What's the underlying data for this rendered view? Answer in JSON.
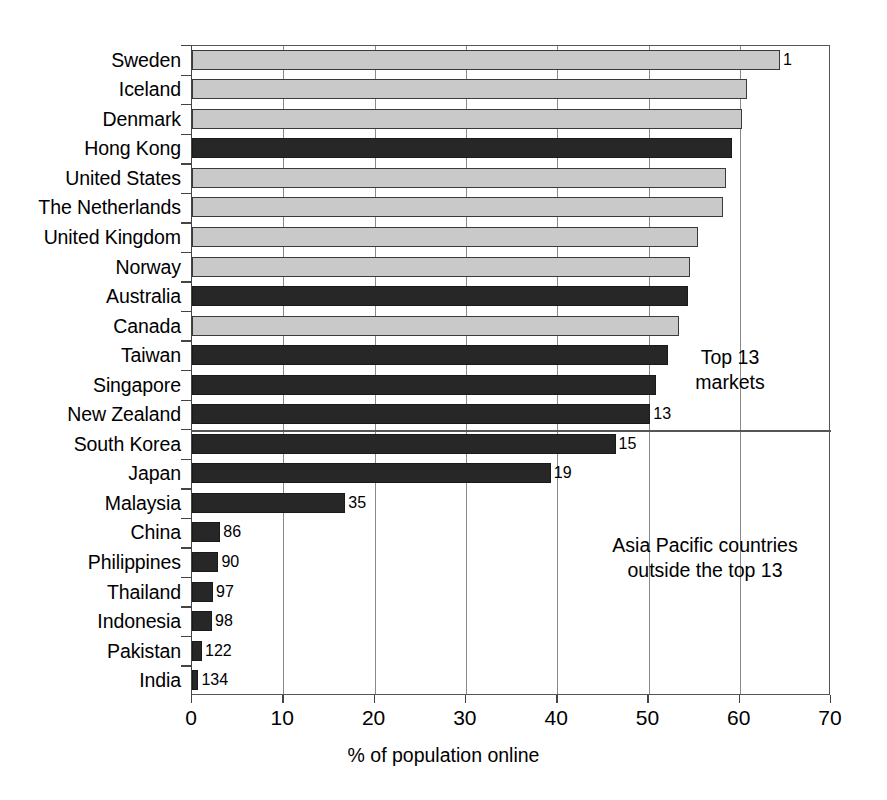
{
  "chart_data": {
    "type": "bar",
    "orientation": "horizontal",
    "title": "",
    "xlabel": "% of population online",
    "ylabel": "",
    "xlim": [
      0,
      70
    ],
    "xticks": [
      0,
      10,
      20,
      30,
      40,
      50,
      60,
      70
    ],
    "grid": "vertical",
    "legend": "none",
    "categories": [
      "Sweden",
      "Iceland",
      "Denmark",
      "Hong Kong",
      "United States",
      "The Netherlands",
      "United Kingdom",
      "Norway",
      "Australia",
      "Canada",
      "Taiwan",
      "Singapore",
      "New Zealand",
      "South Korea",
      "Japan",
      "Malaysia",
      "China",
      "Philippines",
      "Thailand",
      "Indonesia",
      "Pakistan",
      "India"
    ],
    "values": [
      64.4,
      60.8,
      60.3,
      59.2,
      58.5,
      58.2,
      55.4,
      54.5,
      54.3,
      53.3,
      52.1,
      50.8,
      50.2,
      46.4,
      39.3,
      16.8,
      3.1,
      2.9,
      2.3,
      2.2,
      1.1,
      0.7
    ],
    "series_group": [
      "other",
      "other",
      "other",
      "asia-pacific",
      "other",
      "other",
      "other",
      "other",
      "asia-pacific",
      "other",
      "asia-pacific",
      "asia-pacific",
      "asia-pacific",
      "asia-pacific",
      "asia-pacific",
      "asia-pacific",
      "asia-pacific",
      "asia-pacific",
      "asia-pacific",
      "asia-pacific",
      "asia-pacific",
      "asia-pacific"
    ],
    "point_labels": [
      "1",
      "",
      "",
      "",
      "",
      "",
      "",
      "",
      "",
      "",
      "",
      "",
      "13",
      "15",
      "19",
      "35",
      "86",
      "90",
      "97",
      "98",
      "122",
      "134"
    ],
    "annotations": [
      {
        "id": "top",
        "text": "Top 13\nmarkets"
      },
      {
        "id": "bottom",
        "text": "Asia Pacific countries\noutside the top 13"
      }
    ],
    "divider_after_category": "New Zealand",
    "colors": {
      "asia_pacific_bar": "#272727",
      "other_bar": "#c9c9c9",
      "bar_outline": "#3a3a3a",
      "gridline": "#8a8a8a",
      "axis": "#555555",
      "text": "#000000",
      "background": "#ffffff"
    }
  },
  "axis": {
    "tick_labels": [
      "0",
      "10",
      "20",
      "30",
      "40",
      "50",
      "60",
      "70"
    ],
    "title": "% of population online"
  }
}
